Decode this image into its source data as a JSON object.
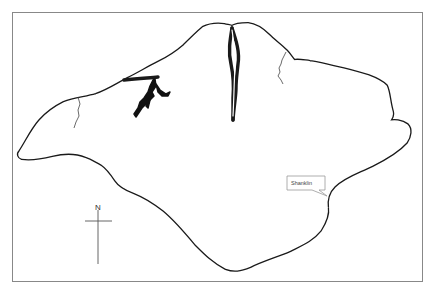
{
  "map": {
    "title": "",
    "compass": {
      "north_label": "N"
    },
    "labels": [
      {
        "name": "Shanklin",
        "text": "Shanklin"
      }
    ],
    "colors": {
      "coastline": "#1a1a1a",
      "land": "#ffffff",
      "frame": "#888888",
      "callout_border": "#999999"
    }
  }
}
